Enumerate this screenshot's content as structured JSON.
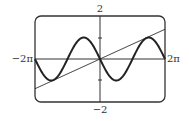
{
  "chart_data": {
    "type": "line",
    "title": "",
    "xlabel": "",
    "ylabel": "",
    "xlim_labels": {
      "min": "−2π",
      "max": "2π"
    },
    "ylim_labels": {
      "min": "−2",
      "max": "2"
    },
    "xlim": [
      -6.2832,
      6.2832
    ],
    "ylim": [
      -2,
      2
    ],
    "y_ticks": [
      -1,
      1
    ],
    "grid": false,
    "legend": null,
    "series": [
      {
        "name": "y = -sin(x)",
        "kind": "function",
        "expr": "-sin(x)",
        "stroke_width": 2
      },
      {
        "name": "y ≈ 0.22x",
        "kind": "function",
        "expr": "0.22*x",
        "stroke_width": 1
      }
    ]
  },
  "labels": {
    "x_min": "−2π",
    "x_max": "2π",
    "y_max": "2",
    "y_min": "−2"
  },
  "colors": {
    "stroke": "#222222",
    "frame": "#333333",
    "background": "#ffffff"
  }
}
